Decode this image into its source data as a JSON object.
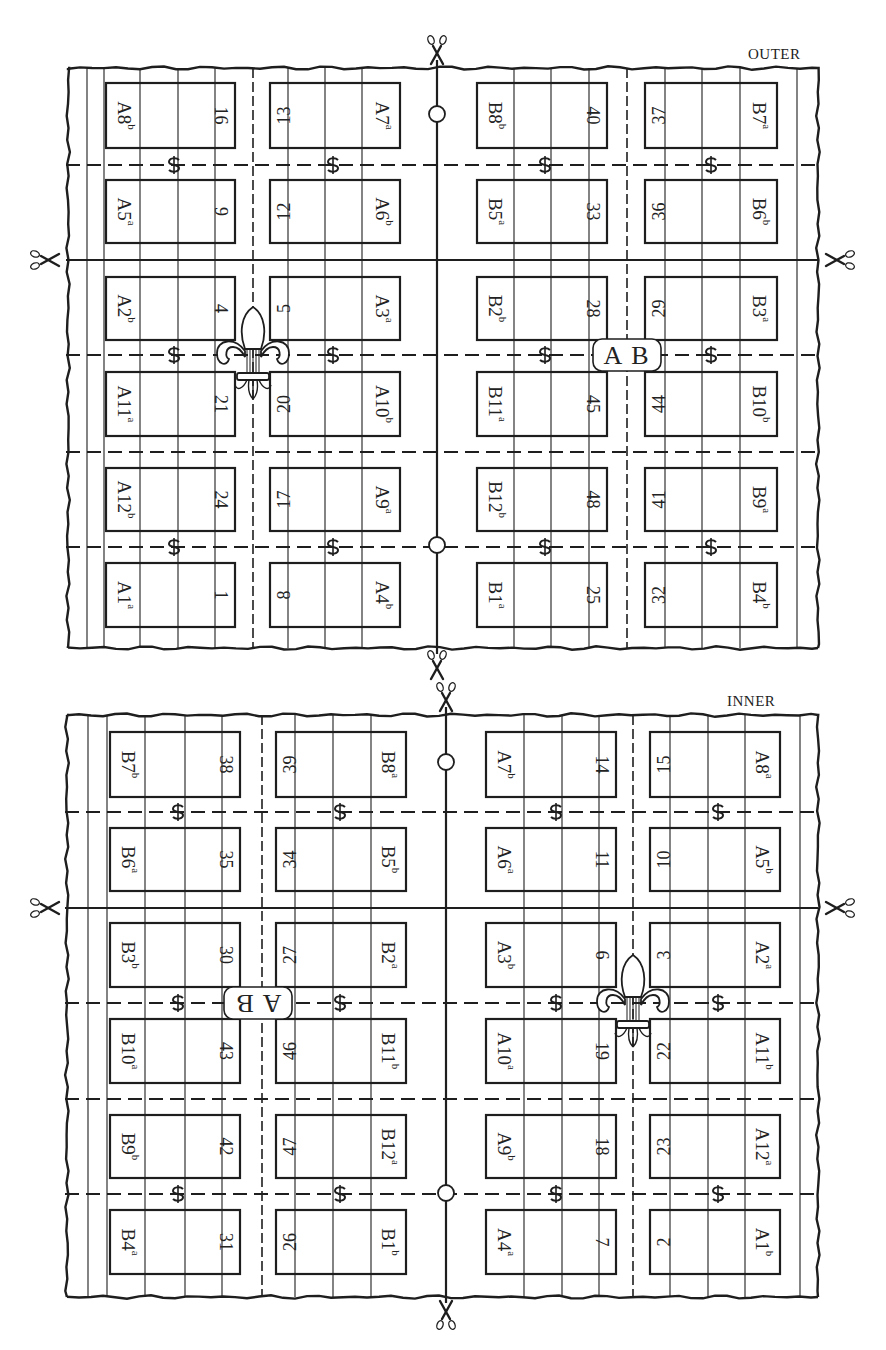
{
  "colors": {
    "ink": "#1e1e1e",
    "paper": "#ffffff"
  },
  "icons": {
    "scissors": "scissors-icon",
    "fold_mark": "dollar-fold-icon",
    "register_circle": "register-circle-icon",
    "fleur_de_lis": "fleur-de-lis-icon",
    "ab_badge": "ab-signature-badge"
  },
  "sheets": [
    {
      "id": "outer",
      "label": "OUTER",
      "label_pos": [
        748,
        62
      ],
      "frame": {
        "left": 68,
        "right": 818,
        "top": 68,
        "bottom": 648
      },
      "margin_lines_left": [
        87,
        104
      ],
      "margin_lines_right": [
        797
      ],
      "grid_verticals": [
        140,
        178,
        215,
        288,
        325,
        362,
        514,
        551,
        589,
        665,
        702,
        740
      ],
      "center_x": 437,
      "dashed_columns": [
        253,
        627
      ],
      "solid_rows": [
        260
      ],
      "dashed_rows": [
        165,
        355,
        452,
        547
      ],
      "col_boxes": [
        [
          106,
          235
        ],
        [
          270,
          400
        ],
        [
          477,
          607
        ],
        [
          645,
          777
        ]
      ],
      "row_boxes": [
        [
          83,
          148
        ],
        [
          180,
          243
        ],
        [
          277,
          340
        ],
        [
          372,
          436
        ],
        [
          468,
          531
        ],
        [
          563,
          627
        ]
      ],
      "fold_marks": [
        [
          174,
          165
        ],
        [
          333,
          165
        ],
        [
          545,
          165
        ],
        [
          711,
          165
        ],
        [
          174,
          355
        ],
        [
          333,
          355
        ],
        [
          545,
          355
        ],
        [
          711,
          355
        ],
        [
          174,
          547
        ],
        [
          333,
          547
        ],
        [
          545,
          547
        ],
        [
          711,
          547
        ]
      ],
      "register_circles": [
        [
          437,
          114
        ],
        [
          437,
          545
        ]
      ],
      "fleur": {
        "x": 253,
        "y": 355
      },
      "badge": {
        "x": 627,
        "y": 355,
        "text": "AB",
        "flipped": false
      },
      "scissors": [
        {
          "x": 437,
          "y": 50,
          "dir": "down"
        },
        {
          "x": 437,
          "y": 665,
          "dir": "down"
        },
        {
          "x": 45,
          "y": 260,
          "dir": "right"
        },
        {
          "x": 840,
          "y": 260,
          "dir": "left"
        }
      ],
      "pages": [
        [
          {
            "sig": "A8",
            "sup": "b",
            "num": "16"
          },
          {
            "sig": "A7",
            "sup": "a",
            "num": "13"
          },
          {
            "sig": "B8",
            "sup": "b",
            "num": "40"
          },
          {
            "sig": "B7",
            "sup": "a",
            "num": "37"
          }
        ],
        [
          {
            "sig": "A5",
            "sup": "a",
            "num": "9"
          },
          {
            "sig": "A6",
            "sup": "b",
            "num": "12"
          },
          {
            "sig": "B5",
            "sup": "a",
            "num": "33"
          },
          {
            "sig": "B6",
            "sup": "b",
            "num": "36"
          }
        ],
        [
          {
            "sig": "A2",
            "sup": "b",
            "num": "4"
          },
          {
            "sig": "A3",
            "sup": "a",
            "num": "5"
          },
          {
            "sig": "B2",
            "sup": "b",
            "num": "28"
          },
          {
            "sig": "B3",
            "sup": "a",
            "num": "29"
          }
        ],
        [
          {
            "sig": "A11",
            "sup": "a",
            "num": "21"
          },
          {
            "sig": "A10",
            "sup": "b",
            "num": "20"
          },
          {
            "sig": "B11",
            "sup": "a",
            "num": "45"
          },
          {
            "sig": "B10",
            "sup": "b",
            "num": "44"
          }
        ],
        [
          {
            "sig": "A12",
            "sup": "b",
            "num": "24"
          },
          {
            "sig": "A9",
            "sup": "a",
            "num": "17"
          },
          {
            "sig": "B12",
            "sup": "b",
            "num": "48"
          },
          {
            "sig": "B9",
            "sup": "a",
            "num": "41"
          }
        ],
        [
          {
            "sig": "A1",
            "sup": "a",
            "num": "1"
          },
          {
            "sig": "A4",
            "sup": "b",
            "num": "8"
          },
          {
            "sig": "B1",
            "sup": "a",
            "num": "25"
          },
          {
            "sig": "B4",
            "sup": "b",
            "num": "32"
          }
        ]
      ]
    },
    {
      "id": "inner",
      "label": "INNER",
      "label_pos": [
        727,
        709
      ],
      "frame": {
        "left": 67,
        "right": 818,
        "top": 715,
        "bottom": 1297
      },
      "margin_lines_left": [
        88,
        107
      ],
      "margin_lines_right": [
        800
      ],
      "grid_verticals": [
        145,
        185,
        222,
        295,
        333,
        371,
        524,
        562,
        599,
        670,
        708,
        745
      ],
      "center_x": 446,
      "dashed_columns": [
        262,
        633
      ],
      "solid_rows": [
        908
      ],
      "dashed_rows": [
        812,
        1003,
        1099,
        1194
      ],
      "col_boxes": [
        [
          110,
          240
        ],
        [
          276,
          406
        ],
        [
          486,
          616
        ],
        [
          650,
          780
        ]
      ],
      "row_boxes": [
        [
          732,
          797
        ],
        [
          828,
          891
        ],
        [
          923,
          987
        ],
        [
          1019,
          1083
        ],
        [
          1115,
          1178
        ],
        [
          1210,
          1274
        ]
      ],
      "fold_marks": [
        [
          178,
          812
        ],
        [
          340,
          812
        ],
        [
          556,
          812
        ],
        [
          718,
          812
        ],
        [
          178,
          1003
        ],
        [
          340,
          1003
        ],
        [
          556,
          1003
        ],
        [
          718,
          1003
        ],
        [
          178,
          1194
        ],
        [
          340,
          1194
        ],
        [
          556,
          1194
        ],
        [
          718,
          1194
        ]
      ],
      "register_circles": [
        [
          446,
          762
        ],
        [
          446,
          1193
        ]
      ],
      "fleur": {
        "x": 633,
        "y": 1003
      },
      "badge": {
        "x": 258,
        "y": 1003,
        "text": "AB",
        "flipped": true
      },
      "scissors": [
        {
          "x": 446,
          "y": 697,
          "dir": "down"
        },
        {
          "x": 446,
          "y": 1315,
          "dir": "up"
        },
        {
          "x": 45,
          "y": 908,
          "dir": "right"
        },
        {
          "x": 840,
          "y": 908,
          "dir": "left"
        }
      ],
      "pages": [
        [
          {
            "sig": "B7",
            "sup": "b",
            "num": "38"
          },
          {
            "sig": "B8",
            "sup": "a",
            "num": "39"
          },
          {
            "sig": "A7",
            "sup": "b",
            "num": "14"
          },
          {
            "sig": "A8",
            "sup": "a",
            "num": "15"
          }
        ],
        [
          {
            "sig": "B6",
            "sup": "a",
            "num": "35"
          },
          {
            "sig": "B5",
            "sup": "b",
            "num": "34"
          },
          {
            "sig": "A6",
            "sup": "a",
            "num": "11"
          },
          {
            "sig": "A5",
            "sup": "b",
            "num": "10"
          }
        ],
        [
          {
            "sig": "B3",
            "sup": "b",
            "num": "30"
          },
          {
            "sig": "B2",
            "sup": "a",
            "num": "27"
          },
          {
            "sig": "A3",
            "sup": "b",
            "num": "6"
          },
          {
            "sig": "A2",
            "sup": "a",
            "num": "3"
          }
        ],
        [
          {
            "sig": "B10",
            "sup": "a",
            "num": "43"
          },
          {
            "sig": "B11",
            "sup": "b",
            "num": "46"
          },
          {
            "sig": "A10",
            "sup": "a",
            "num": "19"
          },
          {
            "sig": "A11",
            "sup": "b",
            "num": "22"
          }
        ],
        [
          {
            "sig": "B9",
            "sup": "b",
            "num": "42"
          },
          {
            "sig": "B12",
            "sup": "a",
            "num": "47"
          },
          {
            "sig": "A9",
            "sup": "b",
            "num": "18"
          },
          {
            "sig": "A12",
            "sup": "a",
            "num": "23"
          }
        ],
        [
          {
            "sig": "B4",
            "sup": "a",
            "num": "31"
          },
          {
            "sig": "B1",
            "sup": "b",
            "num": "26"
          },
          {
            "sig": "A4",
            "sup": "a",
            "num": "7"
          },
          {
            "sig": "A1",
            "sup": "b",
            "num": "2"
          }
        ]
      ]
    }
  ]
}
